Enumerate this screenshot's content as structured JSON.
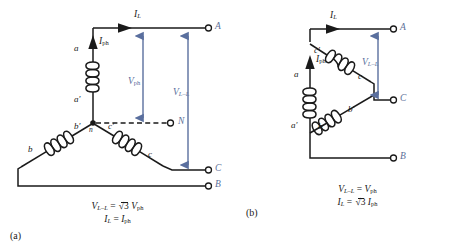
{
  "figure": {
    "colors": {
      "wire": "#1a1a1a",
      "annotation_blue": "#5a6f9e",
      "terminal_label": "#5d7099",
      "background": "#ffffff"
    }
  },
  "panel_a": {
    "caption": "(a)",
    "connection": "wye",
    "terminals": [
      {
        "name": "A",
        "label": "A"
      },
      {
        "name": "C",
        "label": "C"
      },
      {
        "name": "B",
        "label": "B"
      },
      {
        "name": "N",
        "label": "N"
      }
    ],
    "node_label": "n",
    "coil_terminals": {
      "a_start": "a",
      "a_end": "a′",
      "b_start": "b′",
      "b_end": "b",
      "c_start": "c′",
      "c_end": "c"
    },
    "current_line": {
      "symbol": "I",
      "sub": "L"
    },
    "current_phase": {
      "symbol": "I",
      "sub": "ph"
    },
    "voltage_phase": {
      "symbol": "V",
      "sub": "ph"
    },
    "voltage_line": {
      "symbol": "V",
      "sub": "L–L"
    },
    "formula_line1": {
      "lhs_symbol": "V",
      "lhs_sub": "L–L",
      "eq": "=",
      "radical": "3",
      "rhs_symbol": "V",
      "rhs_sub": "ph"
    },
    "formula_line2": {
      "lhs_symbol": "I",
      "lhs_sub": "L",
      "eq": "=",
      "rhs_symbol": "I",
      "rhs_sub": "ph"
    }
  },
  "panel_b": {
    "caption": "(b)",
    "connection": "delta",
    "terminals": [
      {
        "name": "A",
        "label": "A"
      },
      {
        "name": "C",
        "label": "C"
      },
      {
        "name": "B",
        "label": "B"
      }
    ],
    "coil_terminals": {
      "a_start": "a",
      "a_end": "a′",
      "b_start": "b",
      "b_end": "b′",
      "c_start": "c′",
      "c_end": "c"
    },
    "current_line": {
      "symbol": "I",
      "sub": "L"
    },
    "current_phase": {
      "symbol": "I",
      "sub": "ph"
    },
    "voltage_line": {
      "symbol": "V",
      "sub": "L–L"
    },
    "formula_line1": {
      "lhs_symbol": "V",
      "lhs_sub": "L–L",
      "eq": "=",
      "rhs_symbol": "V",
      "rhs_sub": "ph"
    },
    "formula_line2": {
      "lhs_symbol": "I",
      "lhs_sub": "L",
      "eq": "=",
      "radical": "3",
      "rhs_symbol": "I",
      "rhs_sub": "ph"
    }
  }
}
